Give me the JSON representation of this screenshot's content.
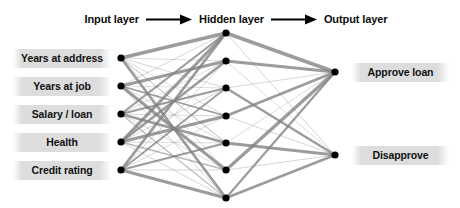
{
  "diagram": {
    "type": "neural-network",
    "title": "",
    "background_color": "#ffffff",
    "node_color": "#000000",
    "edge_color": "#808080",
    "label_background": "#dddddd",
    "header": {
      "input_layer_label": "Input layer",
      "hidden_layer_label": "Hidden layer",
      "output_layer_label": "Output layer",
      "arrow_icon": "right-arrow-icon",
      "arrow_count": 2
    },
    "layers": {
      "input": {
        "name": "Input layer",
        "count": 5,
        "x": 121,
        "node_radius": 3.6,
        "nodes": [
          {
            "label": "Years at address",
            "y": 58
          },
          {
            "label": "Years at job",
            "y": 86
          },
          {
            "label": "Salary / loan",
            "y": 114
          },
          {
            "label": "Health",
            "y": 142
          },
          {
            "label": "Credit rating",
            "y": 170
          }
        ]
      },
      "hidden": {
        "name": "Hidden layer",
        "count": 7,
        "x": 226,
        "node_radius": 3.6,
        "nodes": [
          {
            "label": "",
            "y": 33
          },
          {
            "label": "",
            "y": 61
          },
          {
            "label": "",
            "y": 88
          },
          {
            "label": "",
            "y": 116
          },
          {
            "label": "",
            "y": 143
          },
          {
            "label": "",
            "y": 170
          },
          {
            "label": "",
            "y": 198
          }
        ]
      },
      "output": {
        "name": "Output layer",
        "count": 2,
        "x": 335,
        "node_radius": 3.6,
        "nodes": [
          {
            "label": "Approve loan",
            "y": 72
          },
          {
            "label": "Disapprove",
            "y": 155
          }
        ]
      }
    },
    "edges": {
      "input_to_hidden": [
        {
          "from": 0,
          "to": 0,
          "weight": 3.4
        },
        {
          "from": 0,
          "to": 1,
          "weight": 0.5
        },
        {
          "from": 0,
          "to": 2,
          "weight": 0.6
        },
        {
          "from": 0,
          "to": 3,
          "weight": 0.5
        },
        {
          "from": 0,
          "to": 4,
          "weight": 1.0
        },
        {
          "from": 0,
          "to": 5,
          "weight": 0.5
        },
        {
          "from": 0,
          "to": 6,
          "weight": 2.6
        },
        {
          "from": 1,
          "to": 0,
          "weight": 0.6
        },
        {
          "from": 1,
          "to": 1,
          "weight": 2.9
        },
        {
          "from": 1,
          "to": 2,
          "weight": 0.5
        },
        {
          "from": 1,
          "to": 3,
          "weight": 1.8
        },
        {
          "from": 1,
          "to": 4,
          "weight": 0.5
        },
        {
          "from": 1,
          "to": 5,
          "weight": 3.1
        },
        {
          "from": 1,
          "to": 6,
          "weight": 0.6
        },
        {
          "from": 2,
          "to": 0,
          "weight": 2.2
        },
        {
          "from": 2,
          "to": 1,
          "weight": 0.5
        },
        {
          "from": 2,
          "to": 2,
          "weight": 2.0
        },
        {
          "from": 2,
          "to": 3,
          "weight": 0.6
        },
        {
          "from": 2,
          "to": 4,
          "weight": 2.7
        },
        {
          "from": 2,
          "to": 5,
          "weight": 0.5
        },
        {
          "from": 2,
          "to": 6,
          "weight": 1.1
        },
        {
          "from": 3,
          "to": 0,
          "weight": 3.2
        },
        {
          "from": 3,
          "to": 1,
          "weight": 2.5
        },
        {
          "from": 3,
          "to": 2,
          "weight": 0.6
        },
        {
          "from": 3,
          "to": 3,
          "weight": 3.0
        },
        {
          "from": 3,
          "to": 4,
          "weight": 0.5
        },
        {
          "from": 3,
          "to": 5,
          "weight": 1.4
        },
        {
          "from": 3,
          "to": 6,
          "weight": 0.6
        },
        {
          "from": 4,
          "to": 0,
          "weight": 2.8
        },
        {
          "from": 4,
          "to": 1,
          "weight": 0.6
        },
        {
          "from": 4,
          "to": 2,
          "weight": 1.6
        },
        {
          "from": 4,
          "to": 3,
          "weight": 0.5
        },
        {
          "from": 4,
          "to": 4,
          "weight": 2.3
        },
        {
          "from": 4,
          "to": 5,
          "weight": 0.6
        },
        {
          "from": 4,
          "to": 6,
          "weight": 3.3
        }
      ],
      "hidden_to_output": [
        {
          "from": 0,
          "to": 0,
          "weight": 3.5
        },
        {
          "from": 0,
          "to": 1,
          "weight": 0.6
        },
        {
          "from": 1,
          "to": 0,
          "weight": 3.0
        },
        {
          "from": 1,
          "to": 1,
          "weight": 0.5
        },
        {
          "from": 2,
          "to": 0,
          "weight": 0.6
        },
        {
          "from": 2,
          "to": 1,
          "weight": 2.4
        },
        {
          "from": 3,
          "to": 0,
          "weight": 2.6
        },
        {
          "from": 3,
          "to": 1,
          "weight": 0.6
        },
        {
          "from": 4,
          "to": 0,
          "weight": 0.5
        },
        {
          "from": 4,
          "to": 1,
          "weight": 3.2
        },
        {
          "from": 5,
          "to": 0,
          "weight": 3.3
        },
        {
          "from": 5,
          "to": 1,
          "weight": 0.6
        },
        {
          "from": 6,
          "to": 0,
          "weight": 2.2
        },
        {
          "from": 6,
          "to": 1,
          "weight": 2.8
        }
      ]
    }
  }
}
